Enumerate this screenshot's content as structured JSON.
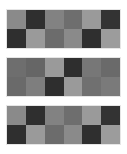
{
  "grids": [
    {
      "top": 10,
      "rows": [
        [
          "#8a8a8a",
          "#2f2f2f",
          "#828282",
          "#6e6e6e",
          "#9a9a9a",
          "#333333"
        ],
        [
          "#2f2f2f",
          "#9a9a9a",
          "#6c6c6c",
          "#8a8a8a",
          "#2f2f2f",
          "#9c9c9c"
        ]
      ]
    },
    {
      "top": 58,
      "rows": [
        [
          "#6e6e6e",
          "#666666",
          "#9a9a9a",
          "#2e2e2e",
          "#777777",
          "#6a6a6a"
        ],
        [
          "#6a6a6a",
          "#7e7e7e",
          "#2e2e2e",
          "#9a9a9a",
          "#707070",
          "#7a7a7a"
        ]
      ]
    },
    {
      "top": 106,
      "rows": [
        [
          "#8a8a8a",
          "#2f2f2f",
          "#828282",
          "#6e6e6e",
          "#9a9a9a",
          "#333333"
        ],
        [
          "#2f2f2f",
          "#9a9a9a",
          "#6c6c6c",
          "#8a8a8a",
          "#2f2f2f",
          "#9c9c9c"
        ]
      ]
    }
  ]
}
